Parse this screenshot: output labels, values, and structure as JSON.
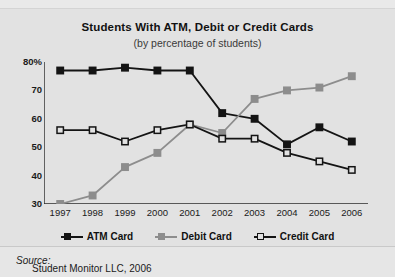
{
  "top_clipped_text": "are debit cards while less than half use credit cards.",
  "chart": {
    "title": "Students With ATM, Debit or Credit Cards",
    "subtitle": "(by percentage of students)"
  },
  "source": {
    "label": "Source:",
    "text": "Student Monitor LLC, 2006"
  },
  "legend": [
    {
      "label": "ATM Card",
      "marker": "filled-square",
      "color": "#141414"
    },
    {
      "label": "Debit Card",
      "marker": "filled-square",
      "color": "#8d8d8d"
    },
    {
      "label": "Credit Card",
      "marker": "open-square",
      "color": "#141414"
    }
  ],
  "chart_data": {
    "type": "line",
    "title": "Students With ATM, Debit or Credit Cards",
    "subtitle": "(by percentage of students)",
    "xlabel": "",
    "ylabel": "",
    "x": [
      1997,
      1998,
      1999,
      2000,
      2001,
      2002,
      2003,
      2004,
      2005,
      2006
    ],
    "categories": [
      "1997",
      "1998",
      "1999",
      "2000",
      "2001",
      "2002",
      "2003",
      "2004",
      "2005",
      "2006"
    ],
    "ylim": [
      30,
      80
    ],
    "yticks": [
      30,
      40,
      50,
      60,
      70,
      80
    ],
    "ytick_labels": [
      "30",
      "40",
      "50",
      "60",
      "70",
      "80%"
    ],
    "grid": false,
    "legend_position": "bottom",
    "series": [
      {
        "name": "ATM Card",
        "color": "#141414",
        "marker": "filled-square",
        "values": [
          77,
          77,
          78,
          77,
          77,
          62,
          60,
          51,
          57,
          52
        ]
      },
      {
        "name": "Debit Card",
        "color": "#8d8d8d",
        "marker": "filled-square",
        "values": [
          30,
          33,
          43,
          48,
          58,
          55,
          67,
          70,
          71,
          75
        ]
      },
      {
        "name": "Credit Card",
        "color": "#141414",
        "marker": "open-square",
        "values": [
          56,
          56,
          52,
          56,
          58,
          53,
          53,
          48,
          45,
          42
        ]
      }
    ]
  }
}
